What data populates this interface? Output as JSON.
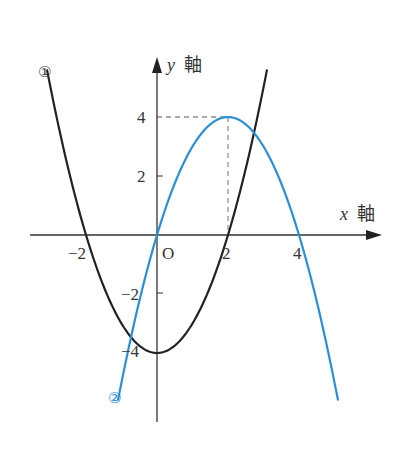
{
  "chart_data": {
    "type": "line",
    "title": "",
    "xlabel": "x 軸",
    "ylabel": "y 軸",
    "xlabel_var": "x",
    "ylabel_var": "y",
    "axis_suffix": "軸",
    "origin_label": "O",
    "x_ticks": [
      {
        "value": -2,
        "label": "−2"
      },
      {
        "value": 2,
        "label": "2"
      },
      {
        "value": 4,
        "label": "4"
      }
    ],
    "y_ticks": [
      {
        "value": 4,
        "label": "4"
      },
      {
        "value": 2,
        "label": "2"
      },
      {
        "value": -2,
        "label": "−2"
      },
      {
        "value": -4,
        "label": "−4"
      }
    ],
    "xlim": [
      -3.6,
      6.3
    ],
    "ylim": [
      -6.3,
      6.0
    ],
    "grid": false,
    "series": [
      {
        "name": "①",
        "equation": "y = x^2 - 4",
        "color": "#222222",
        "x_range": [
          -3.1,
          3.1
        ],
        "points": [
          [
            -3,
            5
          ],
          [
            -2,
            0
          ],
          [
            -1,
            -3
          ],
          [
            0,
            -4
          ],
          [
            1,
            -3
          ],
          [
            2,
            0
          ],
          [
            3,
            5
          ]
        ]
      },
      {
        "name": "②",
        "equation": "y = -x^2 + 4x",
        "color": "#2b8fd6",
        "x_range": [
          -1.1,
          5.1
        ],
        "points": [
          [
            -1,
            -5
          ],
          [
            0,
            0
          ],
          [
            1,
            3
          ],
          [
            2,
            4
          ],
          [
            3,
            3
          ],
          [
            4,
            0
          ],
          [
            5,
            -5
          ]
        ]
      }
    ],
    "annotations": [
      {
        "type": "dashed-guide",
        "description": "vertex of ② at (2, 4)",
        "x": 2,
        "y": 4
      }
    ]
  },
  "labels": {
    "curve1": "①",
    "curve2": "②",
    "x_var": "x",
    "y_var": "y",
    "axis_word": "軸",
    "origin": "O",
    "xt_m2": "−2",
    "xt_2": "2",
    "xt_4": "4",
    "yt_4": "4",
    "yt_2": "2",
    "yt_m2": "−2",
    "yt_m4": "−4"
  }
}
